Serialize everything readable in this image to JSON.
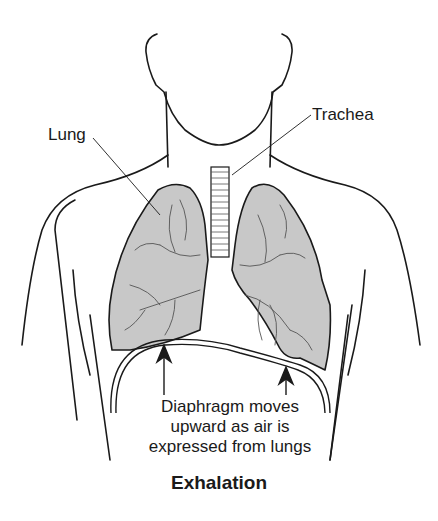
{
  "diagram": {
    "title": "Exhalation",
    "labels": {
      "lung": "Lung",
      "trachea": "Trachea"
    },
    "caption_lines": [
      "Diaphragm moves",
      "upward as air is",
      "expressed from lungs"
    ],
    "colors": {
      "lung_fill": "#c8c8c8",
      "outline": "#1a1a1a",
      "background": "#ffffff"
    }
  }
}
